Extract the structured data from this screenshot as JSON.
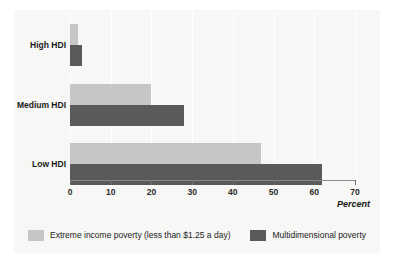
{
  "chart_data": {
    "type": "bar",
    "orientation": "horizontal",
    "title": "",
    "categories": [
      "High HDI",
      "Medium HDI",
      "Low HDI"
    ],
    "series": [
      {
        "name": "Extreme income poverty (less than $1.25 a day)",
        "color": "#c6c6c6",
        "values": [
          2,
          20,
          47
        ]
      },
      {
        "name": "Multidimensional poverty",
        "color": "#5a5a5a",
        "values": [
          3,
          28,
          62
        ]
      }
    ],
    "xlabel": "Percent",
    "ylabel": "",
    "xlim": [
      0,
      70
    ],
    "xticks": [
      0,
      10,
      20,
      30,
      40,
      50,
      60,
      70
    ],
    "xtick_labels": [
      "0",
      "10",
      "20",
      "30",
      "40",
      "50",
      "60",
      "70"
    ],
    "grid": true,
    "grid_axis": "x",
    "legend_position": "bottom"
  },
  "axis": {
    "title": "Percent"
  },
  "legend": {
    "items": [
      {
        "label": "Extreme income poverty (less than $1.25 a day)",
        "color": "#c6c6c6"
      },
      {
        "label": "Multidimensional poverty",
        "color": "#5a5a5a"
      }
    ]
  },
  "colors": {
    "light_series": "#c6c6c6",
    "dark_series": "#5a5a5a",
    "panel_background": "#f7f7f5",
    "gridline": "#ffffff",
    "axis_line": "#8a8a8a",
    "text": "#1a1a1a"
  }
}
